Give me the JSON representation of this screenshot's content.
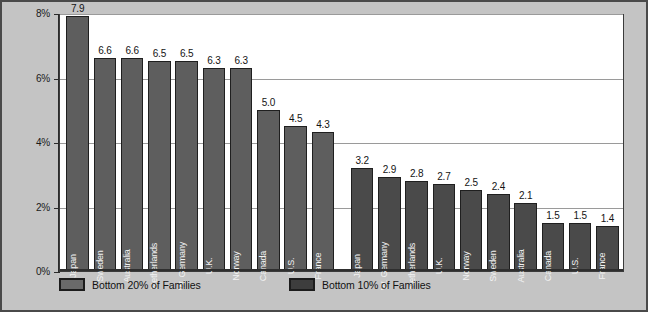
{
  "chart_data": {
    "type": "bar",
    "title": "",
    "xlabel": "",
    "ylabel": "",
    "ylim": [
      0,
      8
    ],
    "ytick_labels": [
      "0%",
      "2%",
      "4%",
      "6%",
      "8%"
    ],
    "ytick_values": [
      0,
      2,
      4,
      6,
      8
    ],
    "grid": true,
    "legend_position": "bottom",
    "groups": [
      {
        "series_name": "Bottom 20% of Families",
        "categories": [
          "Japan",
          "Sweden",
          "Australia",
          "Netherlands",
          "W. Germany",
          "U.K.",
          "Norway",
          "Canada",
          "U.S.",
          "France"
        ],
        "values": [
          7.9,
          6.6,
          6.6,
          6.5,
          6.5,
          6.3,
          6.3,
          5.0,
          4.5,
          4.3
        ],
        "value_labels": [
          "7.9",
          "6.6",
          "6.6",
          "6.5",
          "6.5",
          "6.3",
          "6.3",
          "5.0",
          "4.5",
          "4.3"
        ]
      },
      {
        "series_name": "Bottom 10% of Families",
        "categories": [
          "Japan",
          "W. Germany",
          "Netherlands",
          "U.K.",
          "Norway",
          "Sweden",
          "Australia",
          "Canada",
          "U.S.",
          "France"
        ],
        "values": [
          3.2,
          2.9,
          2.8,
          2.7,
          2.5,
          2.4,
          2.1,
          1.5,
          1.5,
          1.4
        ],
        "value_labels": [
          "3.2",
          "2.9",
          "2.8",
          "2.7",
          "2.5",
          "2.4",
          "2.1",
          "1.5",
          "1.5",
          "1.4"
        ]
      }
    ],
    "colors": {
      "series_a": "#5e5e5e",
      "series_b": "#4a4a4a",
      "background": "#c4c4c4",
      "plot_background": "#ffffff",
      "gridline": "#9a9a9a",
      "axis": "#2b2b2b"
    }
  },
  "legend": {
    "items": [
      {
        "label": "Bottom 20% of Families",
        "swatch": "series-a-swatch"
      },
      {
        "label": "Bottom 10% of Families",
        "swatch": "series-b-swatch"
      }
    ]
  }
}
